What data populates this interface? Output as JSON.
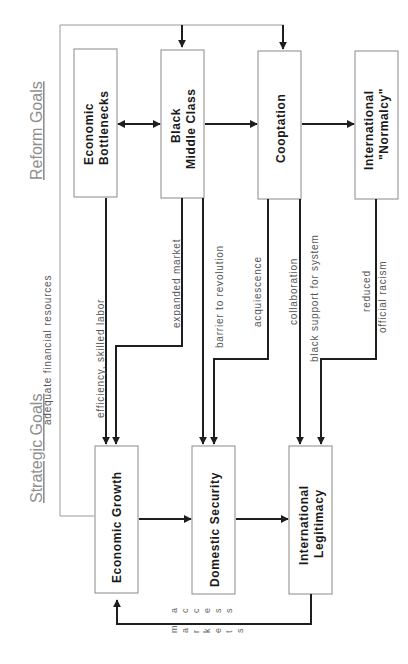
{
  "sections": {
    "reform_goals": "Reform Goals",
    "strategic_goals": "Strategic Goals"
  },
  "reform_boxes": [
    {
      "line1": "Economic",
      "line2": "Bottlenecks"
    },
    {
      "line1": "Black",
      "line2": "Middle Class"
    },
    {
      "line1": "Cooptation",
      "line2": ""
    },
    {
      "line1": "International",
      "line2": "\"Normalcy\""
    }
  ],
  "strategic_boxes": [
    {
      "line1": "Economic Growth",
      "line2": ""
    },
    {
      "line1": "Domestic Security",
      "line2": ""
    },
    {
      "line1": "International",
      "line2": "Legitimacy"
    }
  ],
  "edge_labels": {
    "adequate_financial_resources": "adequate financial resources",
    "efficiency_skilled_labor": "efficiency, skilled labor",
    "expanded_market": "expanded market",
    "barrier_to_revolution": "barrier to revolution",
    "acquiescence": "acquiescence",
    "collaboration": "collaboration",
    "black_support_for_system": "black support for system",
    "reduced": "reduced",
    "official_racism": "official racism",
    "markets": [
      "m",
      "a",
      "r",
      "k",
      "e",
      "t",
      "s"
    ],
    "access": [
      "a",
      "c",
      "c",
      "e",
      "s",
      "s"
    ]
  }
}
